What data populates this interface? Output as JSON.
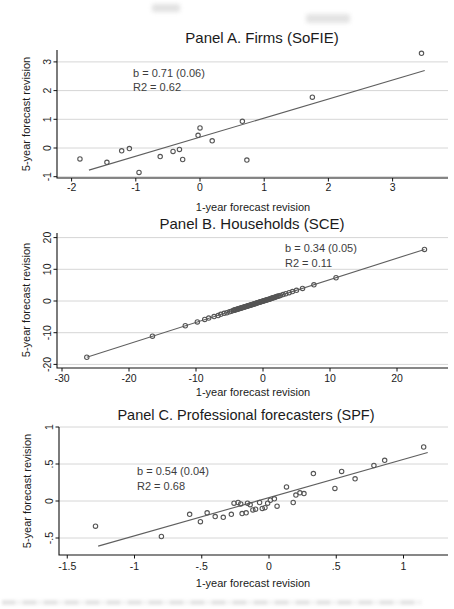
{
  "page": {
    "background": "#ffffff"
  },
  "chart_data": [
    {
      "type": "scatter",
      "title": "Panel A. Firms (SoFIE)",
      "xlabel": "1-year forecast revision",
      "ylabel": "5-year forecast revision",
      "annotation": {
        "line1": "b = 0.71 (0.06)",
        "line2": "R2 = 0.62"
      },
      "stats": {
        "b": 0.71,
        "se": 0.06,
        "r2": 0.62
      },
      "x_ticks": {
        "labels": [
          "-2",
          "-1",
          "0",
          "1",
          "2",
          "3"
        ],
        "values": [
          -2,
          -1,
          0,
          1,
          2,
          3
        ]
      },
      "y_ticks": {
        "labels": [
          "-1",
          "0",
          "1",
          "2",
          "3"
        ],
        "values": [
          -1,
          0,
          1,
          2,
          3
        ]
      },
      "xlim": [
        -2.23,
        3.86
      ],
      "ylim": [
        -1.05,
        3.45
      ],
      "grid": "horizontal",
      "legend": "none",
      "points": [
        [
          -1.87,
          -0.38
        ],
        [
          -1.45,
          -0.5
        ],
        [
          -1.22,
          -0.1
        ],
        [
          -1.1,
          -0.02
        ],
        [
          -0.95,
          -0.85
        ],
        [
          -0.62,
          -0.3
        ],
        [
          -0.42,
          -0.12
        ],
        [
          -0.32,
          -0.05
        ],
        [
          -0.27,
          -0.4
        ],
        [
          -0.03,
          0.44
        ],
        [
          0.0,
          0.7
        ],
        [
          0.19,
          0.25
        ],
        [
          0.66,
          0.93
        ],
        [
          0.73,
          -0.42
        ],
        [
          1.75,
          1.77
        ],
        [
          3.45,
          3.3
        ]
      ],
      "fit_line": {
        "x1": -1.73,
        "y1": -0.77,
        "x2": 3.5,
        "y2": 2.7
      },
      "colors": {
        "marker": "#555555",
        "line": "#5f5f5f",
        "grid": "#d6d6d6",
        "axis": "#111111"
      }
    },
    {
      "type": "scatter",
      "title": "Panel B. Households (SCE)",
      "xlabel": "1-year forecast revision",
      "ylabel": "5-year forecast revision",
      "annotation": {
        "line1": "b = 0.34 (0.05)",
        "line2": "R2 = 0.11"
      },
      "stats": {
        "b": 0.34,
        "se": 0.05,
        "r2": 0.11
      },
      "x_ticks": {
        "labels": [
          "-30",
          "-20",
          "-10",
          "0",
          "10",
          "20"
        ],
        "values": [
          -30,
          -20,
          -10,
          0,
          10,
          20
        ]
      },
      "y_ticks": {
        "labels": [
          "-20",
          "-10",
          "0",
          "10",
          "20"
        ],
        "values": [
          -20,
          -10,
          0,
          10,
          20
        ]
      },
      "xlim": [
        -30.7,
        27.6
      ],
      "ylim": [
        -21.1,
        21.5
      ],
      "grid": "horizontal",
      "legend": "none",
      "points": [
        [
          -26.3,
          -17.75
        ],
        [
          -16.5,
          -11.1
        ],
        [
          -11.6,
          -7.8
        ],
        [
          -9.8,
          -6.6
        ],
        [
          -8.7,
          -5.8
        ],
        [
          -8.1,
          -5.4
        ],
        [
          -7.3,
          -4.9
        ],
        [
          -6.7,
          -4.6
        ],
        [
          -6.3,
          -4.2
        ],
        [
          -5.8,
          -3.9
        ],
        [
          -5.4,
          -3.7
        ],
        [
          -5.0,
          -3.4
        ],
        [
          -4.7,
          -3.2
        ],
        [
          -4.4,
          -2.95
        ],
        [
          -4.28,
          -2.92
        ],
        [
          -4.16,
          -2.78
        ],
        [
          -4.04,
          -2.75
        ],
        [
          -3.92,
          -2.61
        ],
        [
          -3.8,
          -2.59
        ],
        [
          -3.68,
          -2.45
        ],
        [
          -3.56,
          -2.43
        ],
        [
          -3.44,
          -2.29
        ],
        [
          -3.32,
          -2.27
        ],
        [
          -3.2,
          -2.13
        ],
        [
          -3.08,
          -2.11
        ],
        [
          -2.96,
          -1.97
        ],
        [
          -2.84,
          -1.95
        ],
        [
          -2.72,
          -1.81
        ],
        [
          -2.6,
          -1.79
        ],
        [
          -2.48,
          -1.65
        ],
        [
          -2.36,
          -1.63
        ],
        [
          -2.24,
          -1.49
        ],
        [
          -2.12,
          -1.47
        ],
        [
          -2.0,
          -1.33
        ],
        [
          -1.88,
          -1.31
        ],
        [
          -1.76,
          -1.17
        ],
        [
          -1.64,
          -1.15
        ],
        [
          -1.52,
          -1.01
        ],
        [
          -1.4,
          -0.99
        ],
        [
          -1.28,
          -0.85
        ],
        [
          -1.16,
          -0.83
        ],
        [
          -1.04,
          -0.69
        ],
        [
          -0.92,
          -0.67
        ],
        [
          -0.8,
          -0.53
        ],
        [
          -0.68,
          -0.51
        ],
        [
          -0.56,
          -0.37
        ],
        [
          -0.44,
          -0.35
        ],
        [
          -0.32,
          -0.21
        ],
        [
          -0.2,
          -0.19
        ],
        [
          -0.08,
          -0.05
        ],
        [
          0.04,
          -0.03
        ],
        [
          0.16,
          0.11
        ],
        [
          0.28,
          0.13
        ],
        [
          0.4,
          0.27
        ],
        [
          0.52,
          0.29
        ],
        [
          0.64,
          0.43
        ],
        [
          0.76,
          0.45
        ],
        [
          0.9,
          0.59
        ],
        [
          1.04,
          0.66
        ],
        [
          1.18,
          0.81
        ],
        [
          1.32,
          0.87
        ],
        [
          1.46,
          1.0
        ],
        [
          1.6,
          1.06
        ],
        [
          1.75,
          1.2
        ],
        [
          1.9,
          1.26
        ],
        [
          2.05,
          1.4
        ],
        [
          2.2,
          1.46
        ],
        [
          2.35,
          1.6
        ],
        [
          2.6,
          1.74
        ],
        [
          3.0,
          2.04
        ],
        [
          3.4,
          2.28
        ],
        [
          3.9,
          2.62
        ],
        [
          4.4,
          2.96
        ],
        [
          5.0,
          3.36
        ],
        [
          5.9,
          3.96
        ],
        [
          7.6,
          5.1
        ],
        [
          10.9,
          7.33
        ],
        [
          24.1,
          16.27
        ]
      ],
      "fit_line": {
        "x1": -26.3,
        "y1": -17.75,
        "x2": 24.1,
        "y2": 16.27
      },
      "colors": {
        "marker": "#555555",
        "line": "#5f5f5f",
        "grid": "#d6d6d6",
        "axis": "#111111"
      }
    },
    {
      "type": "scatter",
      "title": "Panel C. Professional forecasters (SPF)",
      "xlabel": "1-year forecast revision",
      "ylabel": "5-year forecast revision",
      "annotation": {
        "line1": "b = 0.54 (0.04)",
        "line2": "R2 = 0.68"
      },
      "stats": {
        "b": 0.54,
        "se": 0.04,
        "r2": 0.68
      },
      "x_ticks": {
        "labels": [
          "-1.5",
          "-1",
          "-.5",
          "0",
          ".5",
          "1"
        ],
        "values": [
          -1.5,
          -1,
          -0.5,
          0,
          0.5,
          1
        ]
      },
      "y_ticks": {
        "labels": [
          "-.5",
          "0",
          ".5",
          "1"
        ],
        "values": [
          -0.5,
          0,
          0.5,
          1
        ]
      },
      "xlim": [
        -1.56,
        1.33
      ],
      "ylim": [
        -0.73,
        1.0
      ],
      "grid": "horizontal",
      "legend": "none",
      "points": [
        [
          -1.29,
          -0.34
        ],
        [
          -0.8,
          -0.48
        ],
        [
          -0.59,
          -0.18
        ],
        [
          -0.51,
          -0.28
        ],
        [
          -0.46,
          -0.16
        ],
        [
          -0.4,
          -0.21
        ],
        [
          -0.34,
          -0.22
        ],
        [
          -0.28,
          -0.18
        ],
        [
          -0.26,
          -0.03
        ],
        [
          -0.23,
          -0.02
        ],
        [
          -0.21,
          -0.04
        ],
        [
          -0.2,
          -0.17
        ],
        [
          -0.17,
          -0.16
        ],
        [
          -0.16,
          -0.03
        ],
        [
          -0.14,
          -0.05
        ],
        [
          -0.12,
          -0.12
        ],
        [
          -0.1,
          -0.11
        ],
        [
          -0.07,
          -0.02
        ],
        [
          -0.05,
          -0.1
        ],
        [
          -0.03,
          -0.09
        ],
        [
          -0.01,
          -0.03
        ],
        [
          0.01,
          0.01
        ],
        [
          0.04,
          0.03
        ],
        [
          0.06,
          -0.07
        ],
        [
          0.13,
          0.19
        ],
        [
          0.18,
          -0.02
        ],
        [
          0.2,
          0.08
        ],
        [
          0.23,
          0.11
        ],
        [
          0.26,
          0.1
        ],
        [
          0.33,
          0.37
        ],
        [
          0.49,
          0.17
        ],
        [
          0.54,
          0.4
        ],
        [
          0.64,
          0.3
        ],
        [
          0.78,
          0.48
        ],
        [
          0.86,
          0.55
        ],
        [
          1.15,
          0.73
        ]
      ],
      "fit_line": {
        "x1": -1.27,
        "y1": -0.61,
        "x2": 1.18,
        "y2": 0.655
      },
      "colors": {
        "marker": "#555555",
        "line": "#5f5f5f",
        "grid": "#d6d6d6",
        "axis": "#111111"
      }
    }
  ]
}
